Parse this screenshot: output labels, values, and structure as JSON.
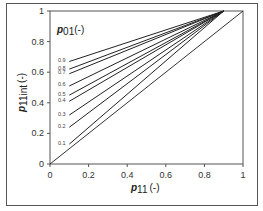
{
  "chart_data": {
    "type": "line",
    "title": "",
    "xlabel": "p11 (-)",
    "xlabel_main": "p",
    "xlabel_sub": "11",
    "xlabel_unit": "(-)",
    "ylabel": "p11int (-)",
    "ylabel_main": "p",
    "ylabel_sub": "11int",
    "ylabel_unit": "(-)",
    "legend_title": "p01(-)",
    "legend_title_main": "p",
    "legend_title_sub": "01",
    "legend_title_unit": "(-)",
    "legend_placement": "top-left",
    "xlim": [
      0,
      1
    ],
    "ylim": [
      0,
      1
    ],
    "xticks": [
      "0",
      "0.2",
      "0.4",
      "0.6",
      "0.8",
      "1"
    ],
    "yticks": [
      "0",
      "0.2",
      "0.4",
      "0.6",
      "0.8",
      "1"
    ],
    "grid": false,
    "series": [
      {
        "name": "0.9",
        "x": [
          0.1,
          0.9
        ],
        "y": [
          0.67,
          1.0
        ]
      },
      {
        "name": "0.8",
        "x": [
          0.1,
          0.9
        ],
        "y": [
          0.62,
          1.0
        ]
      },
      {
        "name": "0.7",
        "x": [
          0.1,
          0.9
        ],
        "y": [
          0.59,
          1.0
        ]
      },
      {
        "name": "0.6",
        "x": [
          0.1,
          0.9
        ],
        "y": [
          0.51,
          1.0
        ]
      },
      {
        "name": "0.5",
        "x": [
          0.1,
          0.9
        ],
        "y": [
          0.45,
          1.0
        ]
      },
      {
        "name": "0.4",
        "x": [
          0.1,
          0.9
        ],
        "y": [
          0.41,
          1.0
        ]
      },
      {
        "name": "0.3",
        "x": [
          0.1,
          0.9
        ],
        "y": [
          0.32,
          1.0
        ]
      },
      {
        "name": "0.2",
        "x": [
          0.1,
          0.9
        ],
        "y": [
          0.24,
          1.0
        ]
      },
      {
        "name": "0.1",
        "x": [
          0.1,
          0.9
        ],
        "y": [
          0.13,
          1.0
        ]
      }
    ],
    "reference_line": {
      "name": "1:1",
      "x": [
        0,
        1
      ],
      "y": [
        0,
        1
      ]
    }
  }
}
